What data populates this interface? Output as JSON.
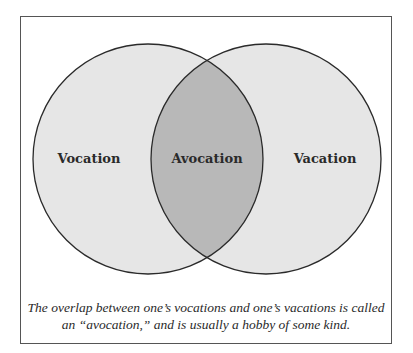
{
  "diagram": {
    "type": "venn",
    "sets": [
      {
        "label": "Vocation",
        "cx": 148,
        "cy": 159,
        "r": 115
      },
      {
        "label": "Vacation",
        "cx": 266,
        "cy": 159,
        "r": 115
      }
    ],
    "intersection_label": "Avocation",
    "colors": {
      "set_fill": "#e6e6e6",
      "overlap_fill": "#b8b8b8",
      "stroke": "#2a2a2a",
      "frame": "#555555"
    }
  },
  "labels": {
    "left": "Vocation",
    "center": "Avocation",
    "right": "Vacation"
  },
  "caption": {
    "line1": "The overlap between one’s vocations and one’s vacations is called",
    "line2": "an “avocation,” and is usually a hobby of some kind."
  }
}
